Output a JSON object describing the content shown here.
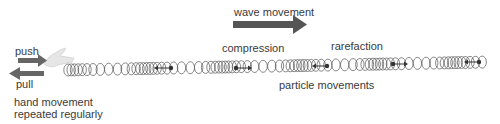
{
  "labels": {
    "wave_movement": "wave movement",
    "push": "push",
    "pull": "pull",
    "hand_line1": "hand movement",
    "hand_line2": "repeated regularly",
    "compression": "compression",
    "rarefaction": "rarefaction",
    "particle_movements": "particle movements"
  },
  "colors": {
    "arrow": "#555555",
    "spring": "#444444",
    "hand": "#e0e0e0",
    "text": "#3a3a3a"
  }
}
